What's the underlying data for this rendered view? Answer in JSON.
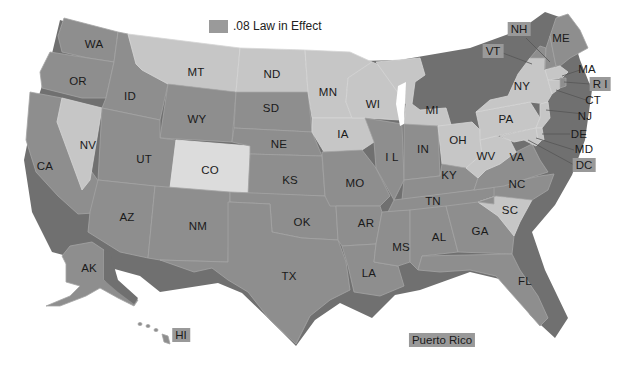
{
  "legend": {
    "label": ".08 Law in Effect",
    "swatch_color": "#9a9a9a"
  },
  "colors": {
    "law_in_effect": "#8e8e8e",
    "no_law": "#c6c6c6",
    "colorado": "#dcdcdc",
    "shadow": "#707070",
    "label_box": "#999999"
  },
  "states": {
    "WA": {
      "label": "WA",
      "law": true
    },
    "OR": {
      "label": "OR",
      "law": true
    },
    "CA": {
      "label": "CA",
      "law": true
    },
    "ID": {
      "label": "ID",
      "law": true
    },
    "NV": {
      "label": "NV",
      "law": false
    },
    "MT": {
      "label": "MT",
      "law": false
    },
    "WY": {
      "label": "WY",
      "law": true
    },
    "UT": {
      "label": "UT",
      "law": true
    },
    "CO": {
      "label": "CO",
      "law": false
    },
    "AZ": {
      "label": "AZ",
      "law": true
    },
    "NM": {
      "label": "NM",
      "law": true
    },
    "ND": {
      "label": "ND",
      "law": false
    },
    "SD": {
      "label": "SD",
      "law": true
    },
    "NE": {
      "label": "NE",
      "law": true
    },
    "KS": {
      "label": "KS",
      "law": true
    },
    "OK": {
      "label": "OK",
      "law": true
    },
    "TX": {
      "label": "TX",
      "law": true
    },
    "MN": {
      "label": "MN",
      "law": false
    },
    "IA": {
      "label": "IA",
      "law": false
    },
    "MO": {
      "label": "MO",
      "law": true
    },
    "AR": {
      "label": "AR",
      "law": true
    },
    "LA": {
      "label": "LA",
      "law": true
    },
    "WI": {
      "label": "WI",
      "law": false
    },
    "IL": {
      "label": "I L",
      "law": true
    },
    "MI": {
      "label": "MI",
      "law": false
    },
    "IN": {
      "label": "IN",
      "law": true
    },
    "OH": {
      "label": "OH",
      "law": false
    },
    "KY": {
      "label": "KY",
      "law": true
    },
    "TN": {
      "label": "TN",
      "law": true
    },
    "MS": {
      "label": "MS",
      "law": true
    },
    "AL": {
      "label": "AL",
      "law": true
    },
    "GA": {
      "label": "GA",
      "law": true
    },
    "FL": {
      "label": "FL",
      "law": true
    },
    "SC": {
      "label": "SC",
      "law": false
    },
    "NC": {
      "label": "NC",
      "law": true
    },
    "VA": {
      "label": "VA",
      "law": true
    },
    "WV": {
      "label": "WV",
      "law": false
    },
    "PA": {
      "label": "PA",
      "law": false
    },
    "NY": {
      "label": "NY",
      "law": false
    },
    "VT": {
      "label": "VT",
      "law": true
    },
    "NH": {
      "label": "NH",
      "law": true
    },
    "ME": {
      "label": "ME",
      "law": true
    },
    "MA": {
      "label": "MA",
      "law": false
    },
    "RI": {
      "label": "R I",
      "law": true
    },
    "CT": {
      "label": "CT",
      "law": false
    },
    "NJ": {
      "label": "NJ",
      "law": false
    },
    "DE": {
      "label": "DE",
      "law": false
    },
    "MD": {
      "label": "MD",
      "law": false
    },
    "DC": {
      "label": "DC",
      "law": true
    },
    "AK": {
      "label": "AK",
      "law": true
    },
    "HI": {
      "label": "HI",
      "law": true
    }
  },
  "territories": {
    "PR": {
      "label": "Puerto Rico",
      "law": true
    }
  }
}
